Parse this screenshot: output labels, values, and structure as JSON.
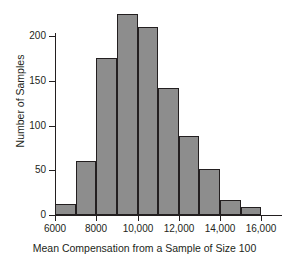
{
  "chart_data": {
    "type": "bar",
    "title": "",
    "xlabel": "Mean Compensation from a Sample of Size 100",
    "ylabel": "Number of Samples",
    "bin_width": 1000,
    "bin_edges": [
      6000,
      7000,
      8000,
      9000,
      10000,
      11000,
      12000,
      13000,
      14000,
      15000,
      16000
    ],
    "categories": [
      "6000-7000",
      "7000-8000",
      "8000-9000",
      "9000-10,000",
      "10,000-11,000",
      "11,000-12,000",
      "12,000-13,000",
      "13,000-14,000",
      "14,000-15,000",
      "15,000-16,000"
    ],
    "values": [
      12,
      60,
      176,
      225,
      210,
      142,
      88,
      52,
      17,
      9
    ],
    "xlim": [
      6000,
      17000
    ],
    "ylim": [
      0,
      225
    ],
    "x_ticks": [
      6000,
      8000,
      10000,
      12000,
      14000,
      16000
    ],
    "x_tick_labels": [
      "6000",
      "8000",
      "10,000",
      "12,000",
      "14,000",
      "16,000"
    ],
    "y_ticks": [
      0,
      50,
      100,
      150,
      200
    ],
    "y_tick_labels": [
      "0",
      "50",
      "100",
      "150",
      "200"
    ],
    "grid": false,
    "legend": false,
    "bar_fill_color": "#8d8d8d",
    "bar_edge_color": "#231f20",
    "axis_color": "#231f20",
    "background_color": "#ffffff"
  }
}
